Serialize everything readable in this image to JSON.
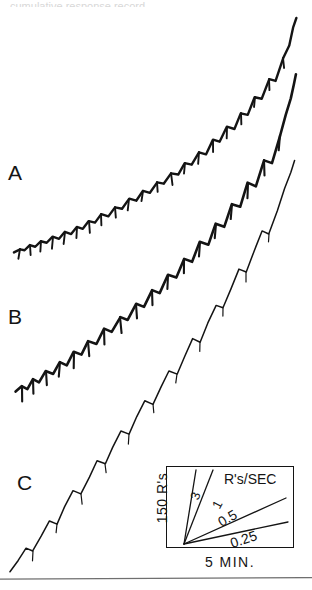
{
  "figure": {
    "background_color": "#ffffff",
    "ink_color": "#141414",
    "width": 312,
    "height": 590,
    "top_artifact_text": "cumulative response record"
  },
  "curves": [
    {
      "id": "A",
      "label": "A",
      "description": "upper cumulative record, scalloped with reinforcement pips"
    },
    {
      "id": "B",
      "label": "B",
      "description": "middle cumulative record, scalloped with long reinforcement pips"
    },
    {
      "id": "C",
      "label": "C",
      "description": "lower cumulative record, steep with sparse pips"
    }
  ],
  "legend": {
    "units_label": "R's/SEC",
    "y_axis_label": "150 R's",
    "x_axis_label": "5 MIN.",
    "rate_lines": [
      {
        "value": "3",
        "label": "3",
        "angle_deg": -72
      },
      {
        "value": "1",
        "label": "1",
        "angle_deg": -62
      },
      {
        "value": "0.5",
        "label": "0.5",
        "angle_deg": -30
      },
      {
        "value": "0.25",
        "label": "0.25",
        "angle_deg": -19
      }
    ]
  },
  "chart_data": {
    "type": "line",
    "title": "",
    "xlabel": "5 MIN.",
    "ylabel": "150 R's",
    "grid": false,
    "legend_position": "inset-bottom-right",
    "axis_note": "Cumulative response records; abscissa = time, ordinate = cumulative responses. Downward pips mark reinforcements.",
    "rate_reference_slopes": [
      3,
      1,
      0.5,
      0.25
    ],
    "rate_reference_units": "R's/SEC",
    "scale_x": "5 MIN.",
    "scale_y": "150 R's",
    "series": [
      {
        "name": "A",
        "pen_width": 2.4,
        "points": [
          [
            14,
            252
          ],
          [
            20,
            249
          ],
          [
            25,
            250
          ],
          [
            30,
            245
          ],
          [
            35,
            247
          ],
          [
            41,
            241
          ],
          [
            47,
            243
          ],
          [
            53,
            237
          ],
          [
            59,
            239
          ],
          [
            65,
            232
          ],
          [
            71,
            234
          ],
          [
            77,
            227
          ],
          [
            83,
            229
          ],
          [
            89,
            221
          ],
          [
            95,
            223
          ],
          [
            101,
            214
          ],
          [
            108,
            216
          ],
          [
            115,
            207
          ],
          [
            122,
            209
          ],
          [
            129,
            199
          ],
          [
            136,
            201
          ],
          [
            143,
            191
          ],
          [
            150,
            193
          ],
          [
            157,
            182
          ],
          [
            164,
            184
          ],
          [
            171,
            173
          ],
          [
            178,
            175
          ],
          [
            185,
            163
          ],
          [
            192,
            165
          ],
          [
            199,
            152
          ],
          [
            206,
            154
          ],
          [
            213,
            140
          ],
          [
            220,
            142
          ],
          [
            227,
            127
          ],
          [
            234,
            129
          ],
          [
            241,
            113
          ],
          [
            248,
            115
          ],
          [
            255,
            97
          ],
          [
            262,
            99
          ],
          [
            269,
            79
          ],
          [
            276,
            81
          ],
          [
            283,
            58
          ],
          [
            289,
            45
          ],
          [
            293,
            28
          ],
          [
            296,
            18
          ]
        ],
        "pips": [
          [
            20,
            249
          ],
          [
            30,
            245
          ],
          [
            41,
            241
          ],
          [
            53,
            237
          ],
          [
            65,
            232
          ],
          [
            77,
            227
          ],
          [
            89,
            221
          ],
          [
            101,
            214
          ],
          [
            115,
            207
          ],
          [
            129,
            199
          ],
          [
            143,
            191
          ],
          [
            157,
            182
          ],
          [
            171,
            173
          ],
          [
            185,
            163
          ],
          [
            199,
            152
          ],
          [
            213,
            140
          ],
          [
            227,
            127
          ],
          [
            241,
            113
          ],
          [
            255,
            97
          ],
          [
            269,
            79
          ],
          [
            283,
            58
          ]
        ]
      },
      {
        "name": "B",
        "pen_width": 2.6,
        "points": [
          [
            16,
            392
          ],
          [
            22,
            386
          ],
          [
            27,
            389
          ],
          [
            33,
            379
          ],
          [
            39,
            382
          ],
          [
            46,
            371
          ],
          [
            53,
            374
          ],
          [
            60,
            362
          ],
          [
            67,
            365
          ],
          [
            74,
            352
          ],
          [
            81,
            355
          ],
          [
            88,
            341
          ],
          [
            96,
            344
          ],
          [
            104,
            329
          ],
          [
            112,
            332
          ],
          [
            120,
            317
          ],
          [
            128,
            320
          ],
          [
            136,
            304
          ],
          [
            144,
            307
          ],
          [
            152,
            290
          ],
          [
            160,
            293
          ],
          [
            168,
            275
          ],
          [
            176,
            278
          ],
          [
            184,
            259
          ],
          [
            192,
            262
          ],
          [
            200,
            242
          ],
          [
            208,
            245
          ],
          [
            216,
            224
          ],
          [
            224,
            227
          ],
          [
            232,
            204
          ],
          [
            240,
            207
          ],
          [
            248,
            183
          ],
          [
            256,
            186
          ],
          [
            264,
            160
          ],
          [
            272,
            163
          ],
          [
            280,
            135
          ],
          [
            286,
            115
          ],
          [
            291,
            98
          ],
          [
            294,
            84
          ],
          [
            296,
            74
          ]
        ],
        "pips": [
          [
            22,
            386
          ],
          [
            33,
            379
          ],
          [
            46,
            371
          ],
          [
            60,
            362
          ],
          [
            74,
            352
          ],
          [
            88,
            341
          ],
          [
            104,
            329
          ],
          [
            120,
            317
          ],
          [
            136,
            304
          ],
          [
            152,
            290
          ],
          [
            168,
            275
          ],
          [
            184,
            259
          ],
          [
            200,
            242
          ],
          [
            216,
            224
          ],
          [
            232,
            204
          ],
          [
            248,
            183
          ],
          [
            264,
            160
          ],
          [
            280,
            135
          ]
        ]
      },
      {
        "name": "C",
        "pen_width": 1.5,
        "points": [
          [
            10,
            572
          ],
          [
            18,
            560
          ],
          [
            26,
            548
          ],
          [
            33,
            551
          ],
          [
            41,
            536
          ],
          [
            49,
            521
          ],
          [
            57,
            524
          ],
          [
            65,
            507
          ],
          [
            73,
            491
          ],
          [
            81,
            494
          ],
          [
            89,
            477
          ],
          [
            97,
            461
          ],
          [
            105,
            464
          ],
          [
            113,
            447
          ],
          [
            121,
            431
          ],
          [
            129,
            434
          ],
          [
            137,
            417
          ],
          [
            145,
            401
          ],
          [
            153,
            404
          ],
          [
            161,
            387
          ],
          [
            169,
            371
          ],
          [
            177,
            374
          ],
          [
            185,
            356
          ],
          [
            193,
            339
          ],
          [
            200,
            342
          ],
          [
            208,
            323
          ],
          [
            216,
            305
          ],
          [
            223,
            308
          ],
          [
            231,
            288
          ],
          [
            239,
            269
          ],
          [
            246,
            272
          ],
          [
            254,
            251
          ],
          [
            262,
            231
          ],
          [
            269,
            234
          ],
          [
            277,
            211
          ],
          [
            285,
            189
          ],
          [
            291,
            172
          ],
          [
            295,
            160
          ]
        ],
        "pips": [
          [
            33,
            551
          ],
          [
            57,
            524
          ],
          [
            81,
            494
          ],
          [
            105,
            464
          ],
          [
            129,
            434
          ],
          [
            153,
            404
          ],
          [
            177,
            374
          ],
          [
            200,
            342
          ],
          [
            223,
            308
          ],
          [
            246,
            272
          ],
          [
            269,
            234
          ]
        ]
      }
    ]
  }
}
